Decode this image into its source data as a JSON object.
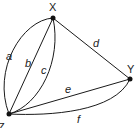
{
  "diagram": {
    "type": "multigraph",
    "vertices": [
      {
        "id": "X",
        "label": "X",
        "x": 53,
        "y": 18
      },
      {
        "id": "Y",
        "label": "Y",
        "x": 130,
        "y": 79
      },
      {
        "id": "Z",
        "label": "Z",
        "x": 9,
        "y": 114
      }
    ],
    "edges": [
      {
        "id": "a",
        "label": "a",
        "from": "Z",
        "to": "X",
        "shape": "outer-curve"
      },
      {
        "id": "b",
        "label": "b",
        "from": "Z",
        "to": "X",
        "shape": "straight"
      },
      {
        "id": "c",
        "label": "c",
        "from": "Z",
        "to": "X",
        "shape": "inner-curve"
      },
      {
        "id": "d",
        "label": "d",
        "from": "X",
        "to": "Y",
        "shape": "straight"
      },
      {
        "id": "e",
        "label": "e",
        "from": "Z",
        "to": "Y",
        "shape": "straight"
      },
      {
        "id": "f",
        "label": "f",
        "from": "Z",
        "to": "Y",
        "shape": "curve-below"
      }
    ],
    "colors": {
      "stroke": "#1a1a1a",
      "background": "#ffffff"
    }
  }
}
